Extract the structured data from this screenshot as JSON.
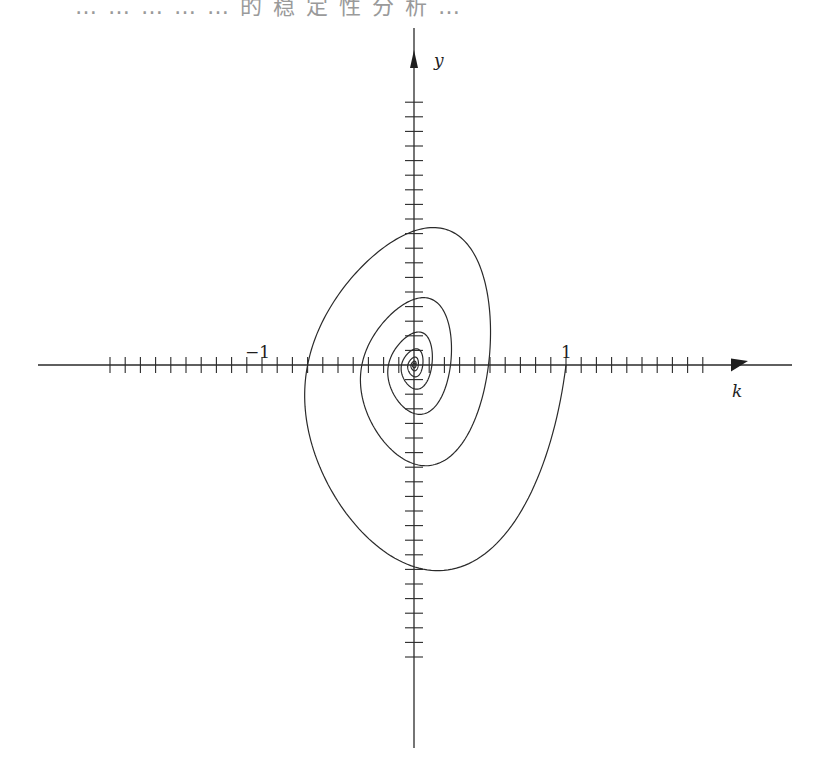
{
  "caption": "… … … … … 的 稳 定 性 分 析 …",
  "chart_data": {
    "type": "line",
    "title": "",
    "xlabel": "k",
    "ylabel": "y",
    "x_tick_step": 0.1,
    "y_tick_step": 0.1,
    "x_tick_range": [
      -2.0,
      1.9
    ],
    "y_tick_range": [
      -2.0,
      1.9
    ],
    "labeled_ticks": [
      {
        "axis": "x",
        "value": -1,
        "label": "−1"
      },
      {
        "axis": "x",
        "value": 1,
        "label": "1"
      }
    ],
    "grid": false,
    "legend": "none",
    "series": [
      {
        "name": "phase-trajectory",
        "description": "clockwise damped spiral starting at (k=1, y=0), converging to origin",
        "start": [
          1,
          0
        ],
        "key_points": [
          {
            "k": 1.0,
            "y": 0.0
          },
          {
            "k": -0.16,
            "y": -1.6
          },
          {
            "k": 0.0,
            "y": -1.55
          },
          {
            "k": -0.74,
            "y": -0.35
          },
          {
            "k": -0.69,
            "y": 0.0
          },
          {
            "k": 0.15,
            "y": 0.88
          },
          {
            "k": 0.0,
            "y": 0.87
          },
          {
            "k": 0.53,
            "y": 0.25
          },
          {
            "k": 0.49,
            "y": 0.0
          },
          {
            "k": 0.0,
            "y": -0.53
          },
          {
            "k": -0.3,
            "y": 0.0
          },
          {
            "k": 0.0,
            "y": 0.34
          },
          {
            "k": 0.0,
            "y": 0.0
          }
        ],
        "damping_per_turn": 0.49,
        "turns": 7
      }
    ]
  }
}
